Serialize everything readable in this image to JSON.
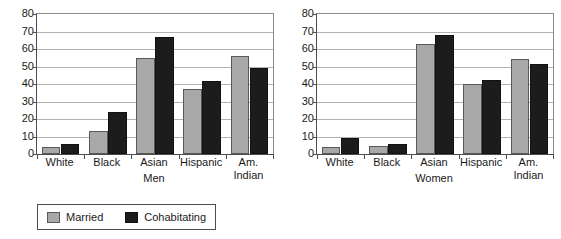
{
  "chart_data": {
    "type": "bar",
    "title": "",
    "categories": [
      "White",
      "Black",
      "Asian",
      "Hispanic",
      "Am. Indian"
    ],
    "category_labels_wrapped": [
      "White",
      "Black",
      "Asian",
      "Hispanic",
      "Am.\nIndian"
    ],
    "ylim": [
      0,
      80
    ],
    "yticks": [
      0,
      10,
      20,
      30,
      40,
      50,
      60,
      70,
      80
    ],
    "ytick_labels": [
      "0",
      "10",
      "20",
      "30",
      "40",
      "50",
      "60",
      "70",
      "80"
    ],
    "ylabel": "",
    "xlabel": "",
    "grid": true,
    "legend_position": "bottom-left",
    "legend": [
      {
        "name": "Married",
        "color": "#a8a8a8"
      },
      {
        "name": "Cohabitating",
        "color": "#1c1c1c"
      }
    ],
    "panels": [
      {
        "id": "men",
        "xlabel": "Men",
        "series": [
          {
            "name": "Married",
            "color": "#a8a8a8",
            "values": [
              4,
              13,
              55,
              37,
              56
            ]
          },
          {
            "name": "Cohabitating",
            "color": "#1c1c1c",
            "values": [
              6,
              24,
              67,
              42,
              49
            ]
          }
        ]
      },
      {
        "id": "women",
        "xlabel": "Women",
        "series": [
          {
            "name": "Married",
            "color": "#a8a8a8",
            "values": [
              4,
              4.5,
              63,
              40,
              54.5
            ]
          },
          {
            "name": "Cohabitating",
            "color": "#1c1c1c",
            "values": [
              9,
              5.5,
              68,
              42.5,
              51.5
            ]
          }
        ]
      }
    ]
  }
}
